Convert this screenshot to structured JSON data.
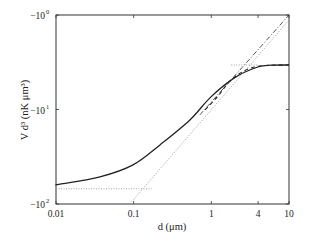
{
  "chart_data": {
    "type": "line",
    "title": "",
    "xlabel": "d (μm)",
    "ylabel": "V d³ (nK μm³)",
    "xscale": "log",
    "yscale": "symlog-negative",
    "xlim": [
      0.01,
      10
    ],
    "ylim": [
      -100,
      -1
    ],
    "grid": false,
    "legend": "none",
    "x_ticks": [
      {
        "value": 0.01,
        "label": "0.01"
      },
      {
        "value": 0.1,
        "label": "0.1"
      },
      {
        "value": 1,
        "label": "1"
      },
      {
        "value": 4,
        "label": "4"
      },
      {
        "value": 10,
        "label": "10"
      }
    ],
    "y_ticks": [
      {
        "value": -1,
        "base": "−10",
        "exp": "0"
      },
      {
        "value": -10,
        "base": "−10",
        "exp": "1"
      },
      {
        "value": -100,
        "base": "−10",
        "exp": "2"
      }
    ],
    "series": [
      {
        "name": "full",
        "style": "solid",
        "x": [
          0.01,
          0.0113,
          0.0368,
          0.098,
          0.218,
          0.53,
          0.98,
          2.0,
          3.97,
          6.0,
          10
        ],
        "y": [
          -62.5,
          -61.6,
          -51.7,
          -38.6,
          -23.7,
          -12.9,
          -7.4,
          -4.6,
          -3.55,
          -3.4,
          -3.38
        ]
      },
      {
        "name": "approximation",
        "style": "dashed",
        "x": [
          0.83,
          1.2,
          1.7,
          2.5,
          3.6,
          5.0,
          10
        ],
        "y": [
          -10.1,
          -7.3,
          -5.1,
          -4.0,
          -3.55,
          -3.42,
          -3.38
        ]
      },
      {
        "name": "asymptote",
        "style": "dashdot",
        "x": [
          0.71,
          10
        ],
        "y": [
          -11.4,
          -1.0
        ]
      },
      {
        "name": "short-range-limit",
        "style": "dotted",
        "x": [
          0.01,
          0.17
        ],
        "y": [
          -69,
          -69
        ]
      },
      {
        "name": "long-range-limit",
        "style": "dotted",
        "x": [
          0.089,
          10
        ],
        "y": [
          -100,
          -1.13
        ]
      },
      {
        "name": "plateau-limit",
        "style": "dotted",
        "x": [
          1.8,
          4.0
        ],
        "y": [
          -3.38,
          -3.38
        ]
      }
    ]
  }
}
